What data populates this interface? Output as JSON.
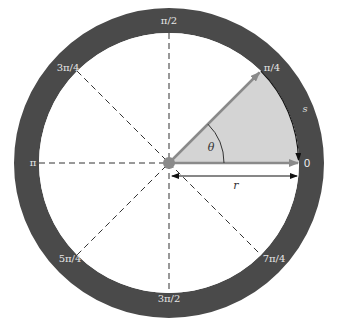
{
  "diagram": {
    "colors": {
      "ring": "#4a4a4a",
      "sector_fill": "#d4d4d4",
      "arrow": "#8a8a8a",
      "center_dot": "#8a8a8a",
      "dashed_line": "#333333",
      "background": "#ffffff"
    },
    "angle_labels": {
      "zero": "0",
      "pi_over_4": "π/4",
      "pi_over_2": "π/2",
      "three_pi_over_4": "3π/4",
      "pi": "π",
      "five_pi_over_4": "5π/4",
      "three_pi_over_2": "3π/2",
      "seven_pi_over_4": "7π/4"
    },
    "variable_labels": {
      "theta": "θ",
      "radius": "r",
      "arc_length": "s"
    }
  }
}
